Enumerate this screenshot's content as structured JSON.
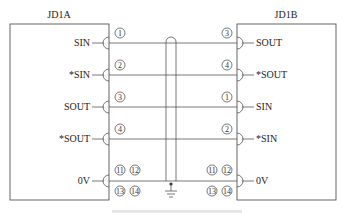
{
  "diagram": {
    "left_unit": {
      "title": "JD1A",
      "pins": [
        {
          "label": "SIN",
          "pin": "1"
        },
        {
          "label": "*SIN",
          "pin": "2"
        },
        {
          "label": "SOUT",
          "pin": "3"
        },
        {
          "label": "*SOUT",
          "pin": "4"
        },
        {
          "label": "0V",
          "pins": [
            "11",
            "12",
            "13",
            "14"
          ]
        }
      ]
    },
    "right_unit": {
      "title": "JD1B",
      "pins": [
        {
          "label": "SOUT",
          "pin": "3"
        },
        {
          "label": "*SOUT",
          "pin": "4"
        },
        {
          "label": "SIN",
          "pin": "1"
        },
        {
          "label": "*SIN",
          "pin": "2"
        },
        {
          "label": "0V",
          "pins": [
            "11",
            "12",
            "13",
            "14"
          ]
        }
      ]
    },
    "shield": {
      "type": "cable-shield",
      "grounded": true
    },
    "caption": ""
  }
}
